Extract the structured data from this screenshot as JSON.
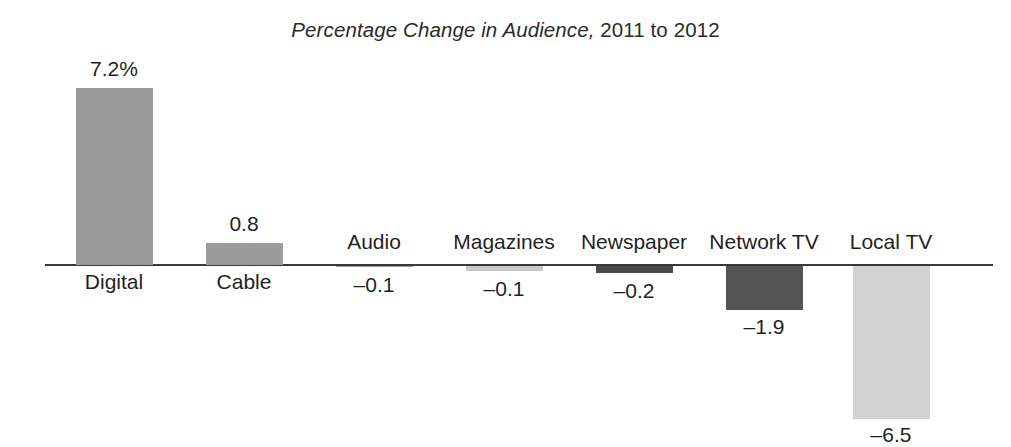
{
  "chart_data": {
    "type": "bar",
    "title": "Percentage Change in Audience, 2011 to 2012",
    "title_italic_part": "Percentage Change in Audience,",
    "title_plain_part": " 2011 to 2012",
    "xlabel": "",
    "ylabel": "",
    "grid": false,
    "legend": "none",
    "baseline": 0,
    "ylim": [
      -7.2,
      8.0
    ],
    "categories": [
      "Digital",
      "Cable",
      "Audio",
      "Magazines",
      "Newspaper",
      "Network TV",
      "Local TV"
    ],
    "values": [
      7.2,
      0.8,
      -0.1,
      -0.1,
      -0.2,
      -1.9,
      -6.5
    ],
    "value_labels": [
      "7.2%",
      "0.8",
      "–0.1",
      "–0.1",
      "–0.2",
      "–1.9",
      "–6.5"
    ],
    "bar_colors": [
      "#9b9b9b",
      "#9b9b9b",
      "#9b9b9b",
      "#c9c9c9",
      "#4a4a4a",
      "#545454",
      "#d2d2d2"
    ],
    "axis_color": "#3a3a3a"
  },
  "bars": [
    {
      "name": "digital",
      "category": "Digital",
      "value": 7.2,
      "value_label": "7.2%",
      "color": "#9b9b9b",
      "left": 76,
      "width": 77,
      "top": 88,
      "height": 177,
      "cat_label_top": 271,
      "val_label_top": 58,
      "label_center": 114
    },
    {
      "name": "cable",
      "category": "Cable",
      "value": 0.8,
      "value_label": "0.8",
      "color": "#9b9b9b",
      "left": 206,
      "width": 77,
      "top": 243,
      "height": 22,
      "cat_label_top": 271,
      "val_label_top": 213,
      "label_center": 244
    },
    {
      "name": "audio",
      "category": "Audio",
      "value": -0.1,
      "value_label": "–0.1",
      "color": "#9b9b9b",
      "left": 336,
      "width": 77,
      "top": 266,
      "height": 1,
      "cat_label_top": 231,
      "val_label_top": 274,
      "label_center": 374
    },
    {
      "name": "magazines",
      "category": "Magazines",
      "value": -0.1,
      "value_label": "–0.1",
      "color": "#c9c9c9",
      "left": 466,
      "width": 77,
      "top": 266,
      "height": 5,
      "cat_label_top": 231,
      "val_label_top": 278,
      "label_center": 504
    },
    {
      "name": "newspaper",
      "category": "Newspaper",
      "value": -0.2,
      "value_label": "–0.2",
      "color": "#4a4a4a",
      "left": 596,
      "width": 77,
      "top": 266,
      "height": 7,
      "cat_label_top": 231,
      "val_label_top": 280,
      "label_center": 634
    },
    {
      "name": "network-tv",
      "category": "Network TV",
      "value": -1.9,
      "value_label": "–1.9",
      "color": "#545454",
      "left": 726,
      "width": 77,
      "top": 266,
      "height": 44,
      "cat_label_top": 231,
      "val_label_top": 316,
      "label_center": 764
    },
    {
      "name": "local-tv",
      "category": "Local TV",
      "value": -6.5,
      "value_label": "–6.5",
      "color": "#d2d2d2",
      "left": 853,
      "width": 77,
      "top": 266,
      "height": 153,
      "cat_label_top": 231,
      "val_label_top": 424,
      "label_center": 891
    }
  ]
}
